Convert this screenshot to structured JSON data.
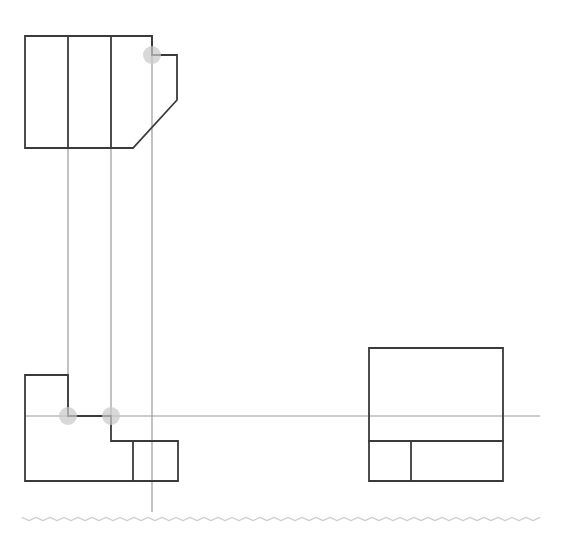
{
  "canvas": {
    "width": 563,
    "height": 536,
    "background": "#ffffff",
    "title": "Orthographic Projection Drawing"
  },
  "style": {
    "object_line_color": "#3a3a3c",
    "object_line_width": 1.8,
    "projection_line_color": "#9a9a9e",
    "projection_line_width": 1.2,
    "marker_fill": "#c9c9c9",
    "marker_stroke": "none",
    "marker_radius": 9,
    "marker_opacity": 0.72,
    "ground_line_color": "#cfcfd3",
    "ground_line_width": 1.2
  },
  "views": {
    "top_view": {
      "name": "top-view",
      "label": "Top View",
      "outline": "M25,36 L152,36 L152,55 L177,55 L177,100 L133,148 L25,148 Z",
      "bounds": {
        "x": 25,
        "y": 36,
        "width": 152,
        "height": 112
      },
      "internal_lines": [
        {
          "name": "divider-1",
          "x1": 68,
          "y1": 36,
          "x2": 68,
          "y2": 148
        },
        {
          "name": "divider-2",
          "x1": 111,
          "y1": 36,
          "x2": 111,
          "y2": 148
        },
        {
          "name": "divider-3",
          "x1": 152,
          "y1": 36,
          "x2": 152,
          "y2": 55
        }
      ]
    },
    "front_view": {
      "name": "front-view",
      "label": "Front View",
      "outline": "M25,375 L68,375 L68,416 L111,416 L111,441 L178,441 L178,481 L25,481 Z",
      "bounds": {
        "x": 25,
        "y": 375,
        "width": 153,
        "height": 106
      },
      "internal_lines": [
        {
          "name": "step-divider",
          "x1": 133,
          "y1": 441,
          "x2": 133,
          "y2": 481
        }
      ]
    },
    "side_view": {
      "name": "side-view",
      "label": "Side View",
      "outline": "M369,348 L503,348 L503,481 L369,481 Z",
      "bounds": {
        "x": 369,
        "y": 348,
        "width": 134,
        "height": 133
      },
      "internal_lines": [
        {
          "name": "horizontal-divider",
          "x1": 369,
          "y1": 441,
          "x2": 503,
          "y2": 441
        },
        {
          "name": "vertical-divider",
          "x1": 411,
          "y1": 441,
          "x2": 411,
          "y2": 481
        }
      ]
    }
  },
  "projection_lines": [
    {
      "name": "vertical-projector-1",
      "x1": 68,
      "y1": 148,
      "x2": 68,
      "y2": 416
    },
    {
      "name": "vertical-projector-2",
      "x1": 111,
      "y1": 148,
      "x2": 111,
      "y2": 416
    },
    {
      "name": "vertical-projector-3",
      "x1": 152,
      "y1": 36,
      "x2": 152,
      "y2": 512
    },
    {
      "name": "horizontal-projector-1",
      "x1": 25,
      "y1": 416,
      "x2": 540,
      "y2": 416
    }
  ],
  "markers": [
    {
      "name": "vertex-marker-top-notch",
      "cx": 152,
      "cy": 55,
      "r": 9
    },
    {
      "name": "vertex-marker-front-step-left",
      "cx": 68,
      "cy": 416,
      "r": 9
    },
    {
      "name": "vertex-marker-front-step-right",
      "cx": 111,
      "cy": 416,
      "r": 9
    }
  ],
  "ground_line": {
    "name": "ground-wavy-line",
    "y": 519,
    "x_start": 22,
    "x_end": 540,
    "amplitude": 1.6,
    "period": 7
  }
}
